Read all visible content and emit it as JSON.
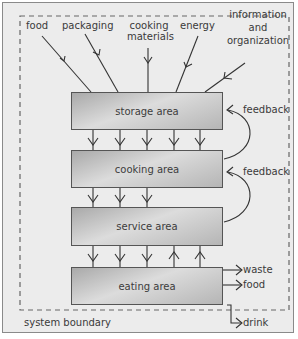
{
  "diagram": {
    "inputs": [
      {
        "id": "food",
        "label": "food"
      },
      {
        "id": "packaging",
        "label": "packaging"
      },
      {
        "id": "cooking-materials",
        "label": "cooking\nmaterials",
        "lines": [
          "cooking",
          "materials"
        ]
      },
      {
        "id": "energy",
        "label": "energy"
      },
      {
        "id": "information-organization",
        "label": "information and organization",
        "lines": [
          "information",
          "and",
          "organization"
        ]
      }
    ],
    "areas": [
      {
        "id": "storage",
        "label": "storage area"
      },
      {
        "id": "cooking",
        "label": "cooking area"
      },
      {
        "id": "service",
        "label": "service area"
      },
      {
        "id": "eating",
        "label": "eating area"
      }
    ],
    "flows": [
      {
        "from": "storage",
        "to": "cooking",
        "arrows_down": 5,
        "arrows_up": 0
      },
      {
        "from": "cooking",
        "to": "service",
        "arrows_down": 3,
        "arrows_up": 0
      },
      {
        "from": "service",
        "to": "eating",
        "arrows_down": 3,
        "arrows_up": 2
      }
    ],
    "feedback": [
      {
        "from": "cooking",
        "to": "storage",
        "label": "feedback"
      },
      {
        "from": "service",
        "to": "cooking",
        "label": "feedback"
      }
    ],
    "outputs": [
      {
        "id": "waste",
        "label": "waste"
      },
      {
        "id": "food-out",
        "label": "food"
      },
      {
        "id": "drink",
        "label": "drink"
      }
    ],
    "boundary_label": "system boundary",
    "colors": {
      "frame_bg": "#ececec",
      "box_fill": "#c4c4c4",
      "line": "#333333",
      "dashed": "#666666"
    }
  }
}
